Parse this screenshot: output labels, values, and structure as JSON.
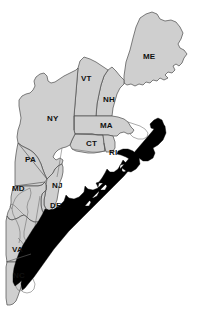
{
  "map": {
    "title": "Northeastern United States map with shaded marine region",
    "colors": {
      "land_fill": "#cfcfcf",
      "land_stroke": "#4a4a4a",
      "highlight_fill": "#000000",
      "background": "#ffffff",
      "label_color": "#111111"
    },
    "highlight_region": {
      "name": "shaded-offshore-region",
      "fill": "#000000"
    },
    "state_labels": [
      {
        "name": "state-label-me",
        "text": "ME",
        "x": 143,
        "y": 53
      },
      {
        "name": "state-label-vt",
        "text": "VT",
        "x": 81,
        "y": 75
      },
      {
        "name": "state-label-nh",
        "text": "NH",
        "x": 103,
        "y": 96
      },
      {
        "name": "state-label-ny",
        "text": "NY",
        "x": 47,
        "y": 115
      },
      {
        "name": "state-label-ma",
        "text": "MA",
        "x": 100,
        "y": 122
      },
      {
        "name": "state-label-ct",
        "text": "CT",
        "x": 86,
        "y": 140
      },
      {
        "name": "state-label-ri",
        "text": "RI",
        "x": 109,
        "y": 149
      },
      {
        "name": "state-label-pa",
        "text": "PA",
        "x": 25,
        "y": 156
      },
      {
        "name": "state-label-nj",
        "text": "NJ",
        "x": 52,
        "y": 182
      },
      {
        "name": "state-label-md",
        "text": "MD",
        "x": 12,
        "y": 185
      },
      {
        "name": "state-label-de",
        "text": "DE",
        "x": 50,
        "y": 202
      },
      {
        "name": "state-label-va",
        "text": "VA",
        "x": 12,
        "y": 246
      },
      {
        "name": "state-label-nc",
        "text": "NC",
        "x": 13,
        "y": 272
      }
    ]
  }
}
